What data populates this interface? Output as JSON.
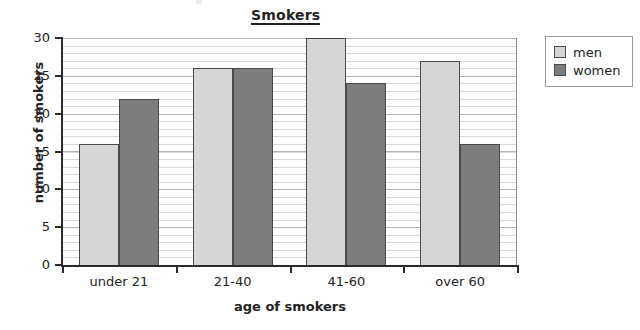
{
  "chart_data": {
    "type": "bar",
    "title": "Smokers",
    "xlabel": "age of smokers",
    "ylabel": "number of smokers",
    "categories": [
      "under 21",
      "21-40",
      "41-60",
      "over 60"
    ],
    "series": [
      {
        "name": "men",
        "color": "#d6d6d6",
        "values": [
          16,
          26,
          30,
          27
        ]
      },
      {
        "name": "women",
        "color": "#7d7d7d",
        "values": [
          22,
          26,
          24,
          16
        ]
      }
    ],
    "ylim": [
      0,
      30
    ],
    "ytick_labels": [
      "0",
      "5",
      "10",
      "15",
      "20",
      "25",
      "30"
    ],
    "ytick_values": [
      0,
      5,
      10,
      15,
      20,
      25,
      30
    ],
    "grid": "horizontal",
    "legend_position": "right-outside"
  },
  "legend": {
    "entries": [
      {
        "label": "men"
      },
      {
        "label": "women"
      }
    ]
  }
}
